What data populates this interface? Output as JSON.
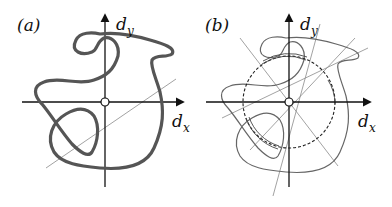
{
  "panels": [
    {
      "id": "a",
      "label": "(a)",
      "axes": {
        "x_label": "d",
        "x_sub": "x",
        "y_label": "d",
        "y_sub": "y"
      },
      "description": "Closed self-intersecting thick curve around origin with one thin ray through origin"
    },
    {
      "id": "b",
      "label": "(b)",
      "axes": {
        "x_label": "d",
        "x_sub": "x",
        "y_label": "d",
        "y_sub": "y"
      },
      "description": "Same curve (thin) with dashed circle centered at origin, multiple rays through origin and highlighted arcs"
    }
  ],
  "colors": {
    "curve": "#555555",
    "axis": "#111111",
    "ray": "#8a8a8a",
    "circle": "#222222"
  }
}
